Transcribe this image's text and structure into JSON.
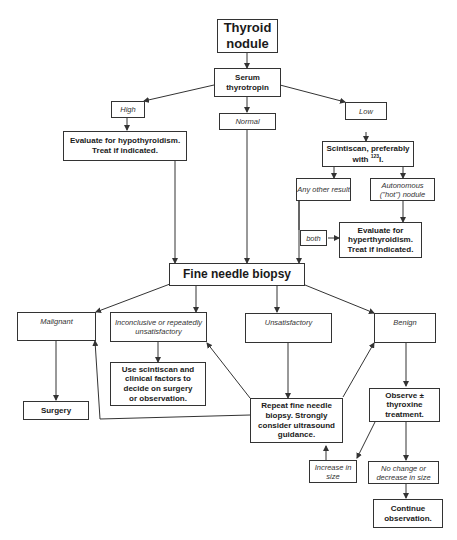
{
  "diagram": {
    "nodes": {
      "thyroid_nodule": "Thyroid nodule",
      "serum_tsh": "Serum thyrotropin",
      "high": "High",
      "normal": "Normal",
      "low": "Low",
      "eval_hypo": "Evaluate for hypothyroidism. Treat if indicated.",
      "scintiscan": "Scintiscan, preferably with ",
      "scintiscan_isotope_sup": "123",
      "scintiscan_isotope": "I.",
      "any_other": "Any other result",
      "autonomous": "Autonomous (\"hot\") nodule",
      "both": "both",
      "eval_hyper": "Evaluate for hyperthyroidism. Treat if indicated.",
      "fnb": "Fine needle biopsy",
      "malignant": "Malignant",
      "inconclusive": "Inconclusive or repeatedly unsatisfactory",
      "unsatisfactory": "Unsatisfactory",
      "benign": "Benign",
      "surgery": "Surgery",
      "use_scintiscan": "Use scintiscan and clinical factors to decide on surgery or observation.",
      "repeat_fnb": "Repeat fine needle biopsy. Strongly consider ultrasound guidance.",
      "observe": "Observe ± thyroxine treatment.",
      "increase": "Increase in size",
      "no_change": "No change or decrease in size",
      "continue": "Continue observation."
    },
    "line_color": "#333333"
  }
}
